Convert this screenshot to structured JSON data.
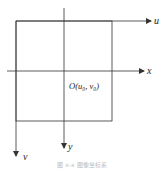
{
  "diagram": {
    "colors": {
      "line": "#333333",
      "label": "#222222",
      "caption": "#bbbbbb"
    },
    "axes": {
      "u": {
        "label": "u"
      },
      "v": {
        "label": "v"
      },
      "x": {
        "label": "x"
      },
      "y": {
        "label": "y"
      }
    },
    "origin_label": "O(u₀, v₀)",
    "caption": "图 x-x 图像坐标系"
  }
}
